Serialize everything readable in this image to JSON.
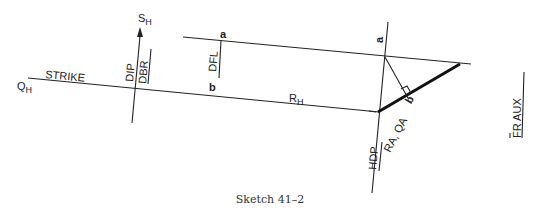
{
  "diagram": {
    "caption": "Sketch 41–2",
    "labels": {
      "q_h_main": "Q",
      "q_h_sub": "H",
      "strike": "STRIKE",
      "s_h_main": "S",
      "s_h_sub": "H",
      "dip": "DIP",
      "dbr": "DBR",
      "dfl": "DFL",
      "point_a_left": "a",
      "point_b_left": "b",
      "r_h_main": "R",
      "r_h_sub": "H",
      "point_a_right": "a",
      "point_b_right": "b",
      "hdp": "HDP",
      "ra_qa": "RA, QA",
      "fr_aux": "FR AUX"
    }
  }
}
